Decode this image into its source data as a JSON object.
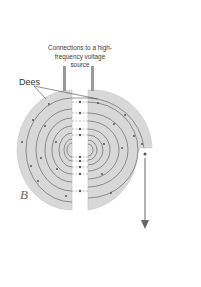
{
  "figure": {
    "labels": {
      "connections": "Connections to a high-frequency voltage source",
      "connections_lines": [
        "Connections to a high-",
        "frequency voltage",
        "source"
      ],
      "dees": "Dees",
      "magnetic_field": "B"
    },
    "colors": {
      "dee_fill": "#d6d6d6",
      "dee_edge": "#bdbdbd",
      "path_line": "#555555",
      "particle": "#555555",
      "arrow": "#666666",
      "background": "#ffffff"
    },
    "components": {
      "left_dee": "semicircular D-shaped electrode (left)",
      "right_dee": "semicircular D-shaped electrode (right) with exit notch",
      "gap": "accelerating gap between dees",
      "spiral_path": "particle spiral trajectory",
      "exit_beam": "extracted particle beam arrow pointing downward"
    }
  }
}
